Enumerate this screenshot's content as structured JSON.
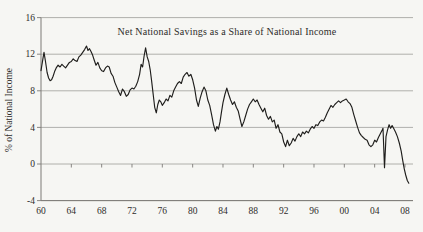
{
  "chart_data": {
    "type": "line",
    "title": "Net National Savings as a Share of National Income",
    "xlabel": "",
    "ylabel": "% of National Income",
    "x_range": [
      1960,
      2009
    ],
    "ylim": [
      -4,
      16
    ],
    "grid": "horizontal-gridlines-at-y-ticks",
    "legend": "none",
    "y_ticks": {
      "values": [
        16,
        12,
        8,
        4,
        0,
        -4
      ],
      "labels": [
        "16",
        "12",
        "8",
        "4",
        "0",
        "-4"
      ]
    },
    "x_ticks": {
      "values": [
        1960,
        1964,
        1968,
        1972,
        1976,
        1980,
        1984,
        1988,
        1992,
        1996,
        2000,
        2004,
        2008
      ],
      "labels": [
        "60",
        "64",
        "68",
        "72",
        "76",
        "80",
        "84",
        "88",
        "92",
        "96",
        "00",
        "04",
        "08"
      ]
    },
    "colors": {
      "line": "#1f1e1c",
      "grid": "#989document894",
      "axis": "#7d7b77",
      "text": "#2e2c2a",
      "background": "#f6f6f3"
    },
    "series": [
      {
        "name": "Net national savings as a share of national income (%)",
        "points": [
          [
            1960.0,
            10.2
          ],
          [
            1960.25,
            11.5
          ],
          [
            1960.4,
            12.2
          ],
          [
            1960.6,
            11.2
          ],
          [
            1960.8,
            10.0
          ],
          [
            1961.0,
            9.4
          ],
          [
            1961.2,
            9.1
          ],
          [
            1961.4,
            9.2
          ],
          [
            1961.6,
            9.6
          ],
          [
            1961.8,
            10.1
          ],
          [
            1962.0,
            10.5
          ],
          [
            1962.25,
            10.8
          ],
          [
            1962.5,
            10.6
          ],
          [
            1962.75,
            10.9
          ],
          [
            1963.0,
            10.7
          ],
          [
            1963.25,
            10.5
          ],
          [
            1963.5,
            10.8
          ],
          [
            1963.75,
            11.1
          ],
          [
            1964.0,
            11.2
          ],
          [
            1964.25,
            11.5
          ],
          [
            1964.5,
            11.3
          ],
          [
            1964.75,
            11.2
          ],
          [
            1965.0,
            11.7
          ],
          [
            1965.25,
            11.9
          ],
          [
            1965.5,
            12.2
          ],
          [
            1965.75,
            12.5
          ],
          [
            1966.0,
            12.9
          ],
          [
            1966.2,
            12.4
          ],
          [
            1966.4,
            12.6
          ],
          [
            1966.6,
            12.3
          ],
          [
            1966.8,
            11.9
          ],
          [
            1967.0,
            11.4
          ],
          [
            1967.25,
            10.8
          ],
          [
            1967.5,
            11.1
          ],
          [
            1967.75,
            10.5
          ],
          [
            1968.0,
            10.2
          ],
          [
            1968.25,
            10.1
          ],
          [
            1968.5,
            10.5
          ],
          [
            1968.75,
            10.7
          ],
          [
            1969.0,
            10.6
          ],
          [
            1969.25,
            9.9
          ],
          [
            1969.5,
            9.6
          ],
          [
            1969.75,
            8.9
          ],
          [
            1970.0,
            8.4
          ],
          [
            1970.25,
            7.9
          ],
          [
            1970.5,
            7.5
          ],
          [
            1970.75,
            8.2
          ],
          [
            1971.0,
            7.9
          ],
          [
            1971.25,
            7.4
          ],
          [
            1971.5,
            7.6
          ],
          [
            1971.75,
            8.1
          ],
          [
            1972.0,
            8.3
          ],
          [
            1972.25,
            8.2
          ],
          [
            1972.5,
            8.5
          ],
          [
            1972.75,
            9.0
          ],
          [
            1973.0,
            9.8
          ],
          [
            1973.2,
            10.9
          ],
          [
            1973.4,
            10.6
          ],
          [
            1973.6,
            11.8
          ],
          [
            1973.8,
            12.7
          ],
          [
            1974.0,
            11.7
          ],
          [
            1974.2,
            11.2
          ],
          [
            1974.4,
            10.3
          ],
          [
            1974.6,
            9.0
          ],
          [
            1974.8,
            7.6
          ],
          [
            1975.0,
            6.2
          ],
          [
            1975.2,
            5.6
          ],
          [
            1975.4,
            6.5
          ],
          [
            1975.6,
            7.0
          ],
          [
            1975.8,
            6.8
          ],
          [
            1976.0,
            6.4
          ],
          [
            1976.25,
            6.7
          ],
          [
            1976.5,
            7.1
          ],
          [
            1976.75,
            6.9
          ],
          [
            1977.0,
            7.5
          ],
          [
            1977.25,
            7.3
          ],
          [
            1977.5,
            8.0
          ],
          [
            1977.75,
            8.4
          ],
          [
            1978.0,
            8.8
          ],
          [
            1978.25,
            9.0
          ],
          [
            1978.5,
            8.8
          ],
          [
            1978.75,
            9.5
          ],
          [
            1979.0,
            9.8
          ],
          [
            1979.25,
            10.0
          ],
          [
            1979.5,
            9.6
          ],
          [
            1979.75,
            9.8
          ],
          [
            1980.0,
            9.2
          ],
          [
            1980.25,
            8.3
          ],
          [
            1980.5,
            7.0
          ],
          [
            1980.75,
            6.3
          ],
          [
            1981.0,
            7.2
          ],
          [
            1981.25,
            7.9
          ],
          [
            1981.5,
            8.4
          ],
          [
            1981.75,
            8.0
          ],
          [
            1982.0,
            7.0
          ],
          [
            1982.25,
            6.4
          ],
          [
            1982.5,
            5.4
          ],
          [
            1982.75,
            4.3
          ],
          [
            1983.0,
            3.6
          ],
          [
            1983.2,
            4.1
          ],
          [
            1983.4,
            3.8
          ],
          [
            1983.6,
            4.6
          ],
          [
            1983.8,
            5.7
          ],
          [
            1984.0,
            6.7
          ],
          [
            1984.25,
            7.6
          ],
          [
            1984.5,
            8.3
          ],
          [
            1984.75,
            7.6
          ],
          [
            1985.0,
            7.0
          ],
          [
            1985.25,
            6.5
          ],
          [
            1985.5,
            6.8
          ],
          [
            1985.75,
            6.2
          ],
          [
            1986.0,
            5.8
          ],
          [
            1986.25,
            4.9
          ],
          [
            1986.5,
            4.1
          ],
          [
            1986.75,
            4.6
          ],
          [
            1987.0,
            5.3
          ],
          [
            1987.25,
            6.0
          ],
          [
            1987.5,
            6.5
          ],
          [
            1987.75,
            6.8
          ],
          [
            1988.0,
            7.1
          ],
          [
            1988.25,
            6.8
          ],
          [
            1988.5,
            7.0
          ],
          [
            1988.75,
            6.5
          ],
          [
            1989.0,
            6.1
          ],
          [
            1989.25,
            5.7
          ],
          [
            1989.5,
            6.1
          ],
          [
            1989.75,
            5.3
          ],
          [
            1990.0,
            4.9
          ],
          [
            1990.25,
            5.2
          ],
          [
            1990.5,
            4.6
          ],
          [
            1990.75,
            4.8
          ],
          [
            1991.0,
            3.9
          ],
          [
            1991.25,
            4.3
          ],
          [
            1991.5,
            3.5
          ],
          [
            1991.75,
            3.3
          ],
          [
            1992.0,
            2.4
          ],
          [
            1992.25,
            1.9
          ],
          [
            1992.5,
            2.6
          ],
          [
            1992.75,
            2.0
          ],
          [
            1993.0,
            2.3
          ],
          [
            1993.25,
            2.8
          ],
          [
            1993.5,
            2.5
          ],
          [
            1993.75,
            3.0
          ],
          [
            1994.0,
            3.3
          ],
          [
            1994.25,
            3.0
          ],
          [
            1994.5,
            3.5
          ],
          [
            1994.75,
            3.3
          ],
          [
            1995.0,
            3.6
          ],
          [
            1995.25,
            3.4
          ],
          [
            1995.5,
            3.8
          ],
          [
            1995.75,
            4.1
          ],
          [
            1996.0,
            3.9
          ],
          [
            1996.25,
            4.3
          ],
          [
            1996.5,
            4.2
          ],
          [
            1996.75,
            4.6
          ],
          [
            1997.0,
            4.8
          ],
          [
            1997.25,
            4.7
          ],
          [
            1997.5,
            5.1
          ],
          [
            1997.75,
            5.6
          ],
          [
            1998.0,
            6.0
          ],
          [
            1998.25,
            6.4
          ],
          [
            1998.5,
            6.2
          ],
          [
            1998.75,
            6.5
          ],
          [
            1999.0,
            6.7
          ],
          [
            1999.25,
            6.9
          ],
          [
            1999.5,
            6.7
          ],
          [
            1999.75,
            6.9
          ],
          [
            2000.0,
            7.0
          ],
          [
            2000.25,
            7.1
          ],
          [
            2000.5,
            6.8
          ],
          [
            2000.75,
            6.6
          ],
          [
            2001.0,
            6.2
          ],
          [
            2001.25,
            5.4
          ],
          [
            2001.5,
            4.7
          ],
          [
            2001.75,
            4.0
          ],
          [
            2002.0,
            3.4
          ],
          [
            2002.25,
            3.1
          ],
          [
            2002.5,
            2.9
          ],
          [
            2002.75,
            2.7
          ],
          [
            2003.0,
            2.6
          ],
          [
            2003.25,
            2.1
          ],
          [
            2003.5,
            1.9
          ],
          [
            2003.75,
            2.1
          ],
          [
            2004.0,
            2.6
          ],
          [
            2004.25,
            2.4
          ],
          [
            2004.5,
            2.9
          ],
          [
            2004.75,
            3.3
          ],
          [
            2005.0,
            3.7
          ],
          [
            2005.1,
            3.9
          ],
          [
            2005.3,
            -0.4
          ],
          [
            2005.5,
            3.0
          ],
          [
            2005.7,
            3.7
          ],
          [
            2005.9,
            4.3
          ],
          [
            2006.1,
            3.9
          ],
          [
            2006.3,
            4.2
          ],
          [
            2006.5,
            3.9
          ],
          [
            2006.75,
            3.5
          ],
          [
            2007.0,
            3.0
          ],
          [
            2007.25,
            2.3
          ],
          [
            2007.5,
            1.4
          ],
          [
            2007.7,
            0.4
          ],
          [
            2007.9,
            -0.5
          ],
          [
            2008.1,
            -1.2
          ],
          [
            2008.3,
            -1.8
          ],
          [
            2008.5,
            -2.1
          ]
        ]
      }
    ]
  }
}
